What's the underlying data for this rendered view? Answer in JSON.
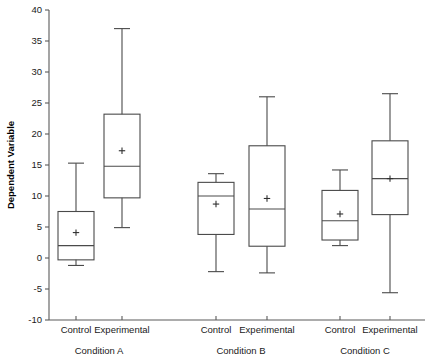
{
  "chart_data": {
    "type": "box",
    "title": "",
    "subtitle": "",
    "xlabel": "",
    "ylabel": "Dependent Variable",
    "ylim": [
      -10,
      40
    ],
    "ytick_values": [
      40,
      35,
      30,
      25,
      20,
      15,
      10,
      5,
      0,
      -5,
      -10
    ],
    "ytick_labels": [
      "40",
      "35",
      "30",
      "25",
      "20",
      "15",
      "10",
      "5",
      "0",
      "-5",
      "-10"
    ],
    "grid": false,
    "legend": "none",
    "mean_marker": "+",
    "groups": [
      "Condition A",
      "Condition B",
      "Condition C"
    ],
    "subcategories": [
      "Control",
      "Experimental"
    ],
    "boxes": [
      {
        "group": "Condition A",
        "subcategory": "Control",
        "whisker_low": -1.2,
        "q1": -0.3,
        "median": 2.0,
        "q3": 7.5,
        "whisker_high": 15.3,
        "mean": 4.1
      },
      {
        "group": "Condition A",
        "subcategory": "Experimental",
        "whisker_low": 4.9,
        "q1": 9.7,
        "median": 14.8,
        "q3": 23.2,
        "whisker_high": 37.0,
        "mean": 17.3
      },
      {
        "group": "Condition B",
        "subcategory": "Control",
        "whisker_low": -2.2,
        "q1": 3.8,
        "median": 10.0,
        "q3": 12.2,
        "whisker_high": 13.6,
        "mean": 8.7
      },
      {
        "group": "Condition B",
        "subcategory": "Experimental",
        "whisker_low": -2.4,
        "q1": 1.9,
        "median": 7.9,
        "q3": 18.1,
        "whisker_high": 26.0,
        "mean": 9.6
      },
      {
        "group": "Condition C",
        "subcategory": "Control",
        "whisker_low": 2.0,
        "q1": 2.9,
        "median": 6.0,
        "q3": 10.9,
        "whisker_high": 14.2,
        "mean": 7.1
      },
      {
        "group": "Condition C",
        "subcategory": "Experimental",
        "whisker_low": -5.6,
        "q1": 7.0,
        "median": 12.8,
        "q3": 18.9,
        "whisker_high": 26.5,
        "mean": 12.8
      }
    ],
    "box_positions_px": [
      76,
      122,
      216,
      267,
      340,
      390
    ],
    "box_width_px": 36,
    "group_label_positions_px": [
      99,
      241,
      365
    ],
    "plot_area_px": {
      "left": 49,
      "right": 425,
      "top": 10,
      "bottom": 320
    }
  }
}
